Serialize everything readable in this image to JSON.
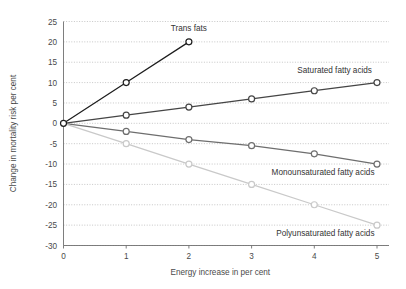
{
  "chart_data": {
    "type": "line",
    "title": "",
    "xlabel": "Energy increase in per cent",
    "ylabel": "Change in mortality risk per cent",
    "xlim": [
      0,
      5
    ],
    "ylim": [
      -30,
      25
    ],
    "xticks": [
      "0",
      "1",
      "2",
      "3",
      "4",
      "5"
    ],
    "yticks": [
      "25",
      "20",
      "15",
      "10",
      "5",
      "0",
      "-5",
      "-10",
      "-15",
      "-20",
      "-25",
      "-30"
    ],
    "grid": true,
    "legend_position": "inline-end-of-line",
    "x": [
      0,
      1,
      2,
      3,
      4,
      5
    ],
    "series": [
      {
        "name": "Trans fats",
        "label": "Trans fats",
        "color": "#1d1d1d",
        "x": [
          0,
          1,
          2
        ],
        "values": [
          0,
          10,
          20
        ],
        "label_x": 2,
        "label_y": 22.6,
        "label_anchor": "middle"
      },
      {
        "name": "Saturated fatty acids",
        "label": "Saturated fatty acids",
        "color": "#454545",
        "x": [
          0,
          1,
          2,
          3,
          4,
          5
        ],
        "values": [
          0,
          2,
          4,
          6,
          8,
          10
        ],
        "label_x": 4.92,
        "label_y": 12.4,
        "label_anchor": "end"
      },
      {
        "name": "Monounsaturated fatty acids",
        "label": "Monounsaturated fatty acids",
        "color": "#6e6e6e",
        "x": [
          0,
          1,
          2,
          3,
          4,
          5
        ],
        "values": [
          0,
          -2,
          -4,
          -5.5,
          -7.5,
          -10
        ],
        "label_x": 4.96,
        "label_y": -12.6,
        "label_anchor": "end"
      },
      {
        "name": "Polyunsaturated fatty acids",
        "label": "Polyunsaturated fatty acids",
        "color": "#c9c9c9",
        "x": [
          0,
          1,
          2,
          3,
          4,
          5
        ],
        "values": [
          0,
          -5,
          -10,
          -15,
          -20,
          -25
        ],
        "label_x": 4.96,
        "label_y": -27.6,
        "label_anchor": "end"
      }
    ]
  }
}
